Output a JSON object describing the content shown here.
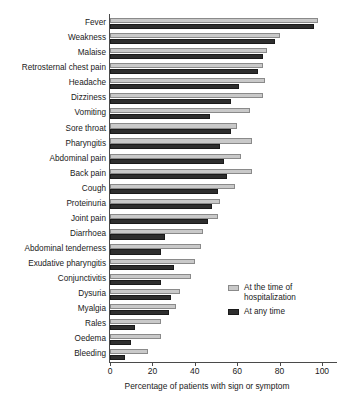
{
  "chart_data": {
    "type": "bar",
    "orientation": "horizontal",
    "title": "",
    "xlabel": "Percentage of patients with sign or symptom",
    "ylabel": "",
    "xlim": [
      0,
      100
    ],
    "xticks": [
      0,
      20,
      40,
      60,
      80,
      100
    ],
    "grid": false,
    "legend_position": "right-inside-lower",
    "categories": [
      "Fever",
      "Weakness",
      "Malaise",
      "Retrosternal chest pain",
      "Headache",
      "Dizziness",
      "Vomiting",
      "Sore throat",
      "Pharyngitis",
      "Abdominal pain",
      "Back pain",
      "Cough",
      "Proteinuria",
      "Joint pain",
      "Diarrhoea",
      "Abdominal tenderness",
      "Exudative pharyngitis",
      "Conjunctivitis",
      "Dysuria",
      "Myalgia",
      "Rales",
      "Oedema",
      "Bleeding"
    ],
    "series": [
      {
        "name": "At the time of hospitalization",
        "color": "#c9c9c9",
        "values": [
          98,
          80,
          74,
          72,
          73,
          72,
          66,
          60,
          67,
          62,
          67,
          59,
          52,
          51,
          44,
          43,
          40,
          38,
          33,
          31,
          24,
          24,
          18
        ]
      },
      {
        "name": "At any time",
        "color": "#2e2e2e",
        "values": [
          96,
          78,
          72,
          70,
          61,
          57,
          47,
          57,
          52,
          54,
          55,
          51,
          48,
          46,
          26,
          24,
          30,
          24,
          29,
          28,
          12,
          10,
          7
        ]
      }
    ]
  },
  "legend": {
    "items": [
      {
        "label": "At the time of\nhospitalization",
        "swatch": "light"
      },
      {
        "label": "At any time",
        "swatch": "dark"
      }
    ]
  },
  "axis": {
    "x_title": "Percentage of patients with sign or symptom"
  }
}
